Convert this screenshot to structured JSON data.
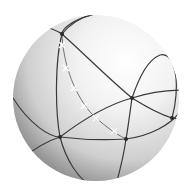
{
  "diagram": {
    "colors": {
      "background": "#ffffff",
      "sphere_light": "#ffffff",
      "sphere_mid": "#cfcfcf",
      "sphere_dark": "#7a7a7a",
      "line": "#3a3a3a",
      "vertex": "#2a2a2a",
      "cross": "#ffffff"
    },
    "vertex_count": 5,
    "cross_marker_count": 6
  }
}
